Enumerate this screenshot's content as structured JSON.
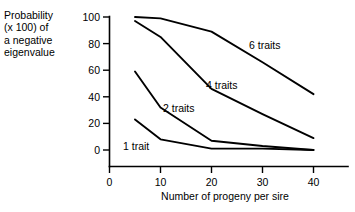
{
  "chart_data": {
    "type": "line",
    "title": "",
    "ylabel": "Probability\n(x 100) of\na negative\neigenvalue",
    "xlabel": "Number of progeny per sire",
    "x": [
      5,
      10,
      20,
      30,
      40
    ],
    "xlim": [
      0,
      45
    ],
    "ylim": [
      0,
      100
    ],
    "xticks": [
      0,
      10,
      20,
      30,
      40
    ],
    "xtick_labels": [
      "0",
      "10",
      "20",
      "30",
      "40"
    ],
    "yticks": [
      0,
      20,
      40,
      60,
      80,
      100
    ],
    "ytick_labels": [
      "0",
      "20",
      "40",
      "60",
      "80",
      "100"
    ],
    "grid": false,
    "legend_position": "inline-annotations",
    "series": [
      {
        "name": "6 traits",
        "label": "6 traits",
        "values": [
          100,
          99,
          89,
          66,
          42
        ]
      },
      {
        "name": "4 traits",
        "label": "4 traits",
        "values": [
          97,
          85,
          46,
          27,
          9
        ]
      },
      {
        "name": "2 traits",
        "label": "2 traits",
        "values": [
          59,
          32,
          7,
          3,
          0
        ]
      },
      {
        "name": "1 trait",
        "label": "1 trait",
        "values": [
          23,
          8,
          1,
          1,
          0
        ]
      }
    ],
    "annotations": [
      {
        "text": "6 traits",
        "x": 28.5,
        "y": 72
      },
      {
        "text": "4 traits",
        "x": 20.5,
        "y": 50
      },
      {
        "text": "2 traits",
        "x": 12.5,
        "y": 31
      },
      {
        "text": "1 trait",
        "x": 5.5,
        "y": 8
      }
    ],
    "colors": {
      "line": "#000000",
      "axis": "#000000",
      "background": "#ffffff"
    }
  },
  "axis": {
    "ytick_0": "0",
    "ytick_1": "20",
    "ytick_2": "40",
    "ytick_3": "60",
    "ytick_4": "80",
    "ytick_5": "100",
    "xtick_0": "0",
    "xtick_1": "10",
    "xtick_2": "20",
    "xtick_3": "30",
    "xtick_4": "40"
  },
  "labels": {
    "y_axis_title": "Probability\n(x 100) of\na negative\neigenvalue",
    "x_axis_title": "Number of progeny per sire"
  },
  "annotation_labels": {
    "six": "6 traits",
    "four": "4 traits",
    "two": "2 traits",
    "one": "1 trait"
  }
}
